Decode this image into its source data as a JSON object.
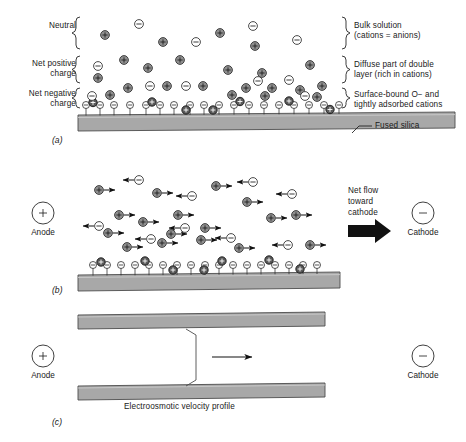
{
  "figure": {
    "colors": {
      "silica_fill": "#a8a8a8",
      "silica_stroke": "#4d4d4d",
      "cation_fill": "#8f8f8f",
      "cation_stroke": "#2b2b2b",
      "cation_adsorbed_fill": "#5a5a5a",
      "anion_fill": "#ffffff",
      "anion_stroke": "#2b2b2b",
      "arrow": "#111111",
      "text": "#1a1a1a"
    }
  },
  "panel_a": {
    "id": "(a)",
    "left_labels": [
      {
        "text": "Neutral",
        "lines": [
          "Neutral"
        ]
      },
      {
        "text": "Net positive charge",
        "lines": [
          "Net positive",
          "charge"
        ]
      },
      {
        "text": "Net negative charge",
        "lines": [
          "Net negative",
          "charge"
        ]
      }
    ],
    "right_labels": [
      {
        "line1": "Bulk solution",
        "line2": "(cations = anions)"
      },
      {
        "line1": "Diffuse part of double",
        "line2": "layer (rich in cations)"
      },
      {
        "line1": "Surface-bound O− and",
        "line2": "tightly adsorbed cations"
      }
    ],
    "substrate_label": "Fused silica",
    "ion_symbols": {
      "cation": "+",
      "anion": "−"
    }
  },
  "panel_b": {
    "id": "(b)",
    "anode_label": "Anode",
    "anode_symbol": "+",
    "cathode_label": "Cathode",
    "cathode_symbol": "−",
    "net_flow_label": {
      "line1": "Net flow",
      "line2": "toward",
      "line3": "cathode"
    },
    "ion_symbols": {
      "cation": "+",
      "anion": "−"
    }
  },
  "panel_c": {
    "id": "(c)",
    "anode_label": "Anode",
    "anode_symbol": "+",
    "cathode_label": "Cathode",
    "cathode_symbol": "−",
    "profile_caption": "Electroosmotic velocity profile"
  }
}
